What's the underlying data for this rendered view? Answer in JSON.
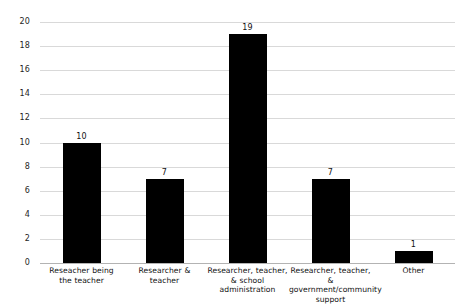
{
  "chart_data": {
    "type": "bar",
    "title": "",
    "subtitle": "",
    "xlabel": "",
    "ylabel": "",
    "ylim": [
      0,
      20
    ],
    "ytick_step": 2,
    "yticks": [
      20,
      18,
      16,
      14,
      12,
      10,
      8,
      6,
      4,
      2,
      0
    ],
    "grid": true,
    "legend": false,
    "legend_position": "none",
    "bar_color": "#000000",
    "gridline_color": "#d9d9d9",
    "axis_color": "#b3b3b3",
    "categories": [
      "Reseacher being the teacher",
      "Researcher & teacher",
      "Researcher, teacher, & school administration",
      "Researcher, teacher, & government/community support",
      "Other"
    ],
    "category_label_lines": [
      [
        "Reseacher being",
        "the teacher"
      ],
      [
        "Researcher & teacher"
      ],
      [
        "Researcher, teacher,",
        "& school administration"
      ],
      [
        "Researcher, teacher, &",
        "government/community",
        "support"
      ],
      [
        "Other"
      ]
    ],
    "values": [
      10,
      7,
      19,
      7,
      1
    ],
    "value_labels": [
      "10",
      "7",
      "19",
      "7",
      "1"
    ]
  }
}
